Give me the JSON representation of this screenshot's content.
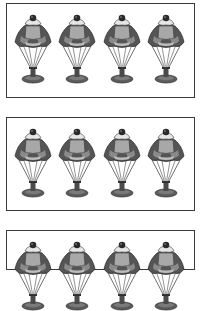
{
  "worksheet": {
    "panels": [
      {
        "id": "panel-1",
        "top": 3,
        "height": 95,
        "item_count": 4,
        "item": "ice-cream-sundae",
        "visible": "full"
      },
      {
        "id": "panel-2",
        "top": 117,
        "height": 94,
        "item_count": 4,
        "item": "ice-cream-sundae",
        "visible": "full"
      },
      {
        "id": "panel-3",
        "top": 230,
        "height": 40,
        "item_count": 4,
        "item": "ice-cream-sundae",
        "visible": "partial"
      }
    ],
    "item_centers_x": [
      33,
      77,
      122,
      166
    ],
    "colors": {
      "border": "#3a3a3a",
      "chocolate": "#555555",
      "ice_cream_light": "#a8a8a8",
      "cream": "#e6e6e6",
      "cherry": "#2a2a2a",
      "glass_line": "#4a4a4a",
      "base": "#5c5c5c"
    }
  }
}
